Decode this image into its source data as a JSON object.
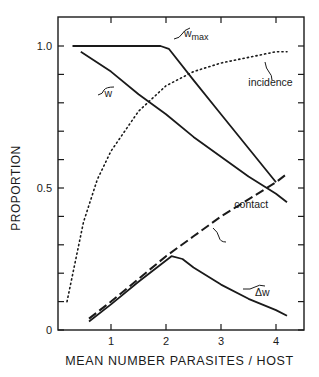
{
  "chart_data": {
    "type": "line",
    "title": "",
    "xlabel": "MEAN NUMBER PARASITES / HOST",
    "ylabel": "PROPORTION",
    "xlim": [
      0,
      4.5
    ],
    "ylim": [
      0,
      1.05
    ],
    "x_ticks": [
      1,
      2,
      3,
      4
    ],
    "x_tick_labels": [
      "1",
      "2",
      "3",
      "4"
    ],
    "y_ticks": [
      0,
      0.1,
      0.2,
      0.3,
      0.4,
      0.5,
      0.6,
      0.7,
      0.8,
      0.9,
      1.0
    ],
    "y_tick_labels": {
      "0": "0",
      "0.5": "0.5",
      "1.0": "1.0"
    },
    "grid": false,
    "legend": "none (curves labeled inline)",
    "series": [
      {
        "name": "w_max",
        "label": "w",
        "label_sub": "max",
        "style": "solid",
        "x": [
          0.3,
          1.0,
          1.5,
          1.9,
          2.05,
          2.5,
          3.0,
          3.5,
          4.0
        ],
        "y": [
          1.0,
          1.0,
          1.0,
          1.0,
          0.99,
          0.88,
          0.76,
          0.64,
          0.52
        ]
      },
      {
        "name": "w",
        "label": "w",
        "style": "solid",
        "x": [
          0.45,
          1.0,
          1.5,
          2.0,
          2.5,
          3.0,
          3.5,
          4.0,
          4.2
        ],
        "y": [
          0.98,
          0.91,
          0.83,
          0.76,
          0.68,
          0.61,
          0.54,
          0.48,
          0.45
        ]
      },
      {
        "name": "incidence",
        "label": "incidence",
        "style": "dotted",
        "x": [
          0.2,
          0.5,
          0.75,
          1.0,
          1.5,
          2.0,
          2.5,
          3.0,
          3.5,
          4.0,
          4.2
        ],
        "y": [
          0.1,
          0.38,
          0.53,
          0.63,
          0.77,
          0.86,
          0.91,
          0.94,
          0.96,
          0.98,
          0.98
        ]
      },
      {
        "name": "contact",
        "label": "contact",
        "style": "dashed",
        "x": [
          0.6,
          1.0,
          1.5,
          2.0,
          2.5,
          3.0,
          3.5,
          4.0,
          4.2
        ],
        "y": [
          0.04,
          0.1,
          0.18,
          0.26,
          0.33,
          0.4,
          0.46,
          0.52,
          0.55
        ]
      },
      {
        "name": "delta_w",
        "label": "Δw",
        "style": "solid",
        "x": [
          0.6,
          1.0,
          1.5,
          1.9,
          2.1,
          2.3,
          2.5,
          3.0,
          3.5,
          4.0,
          4.2
        ],
        "y": [
          0.03,
          0.09,
          0.17,
          0.23,
          0.26,
          0.25,
          0.22,
          0.16,
          0.11,
          0.07,
          0.05
        ]
      }
    ],
    "annotations": [
      {
        "text": "w",
        "sub": "max",
        "x": 2.55,
        "y": 1.03
      },
      {
        "text": "w",
        "x": 0.95,
        "y": 0.82
      },
      {
        "text": "incidence",
        "x": 3.9,
        "y": 0.86
      },
      {
        "text": "contact",
        "x": 3.55,
        "y": 0.43
      },
      {
        "text": "Δw",
        "x": 3.75,
        "y": 0.12
      }
    ]
  },
  "colors": {
    "ink": "#1a1a1a",
    "background": "#ffffff"
  }
}
